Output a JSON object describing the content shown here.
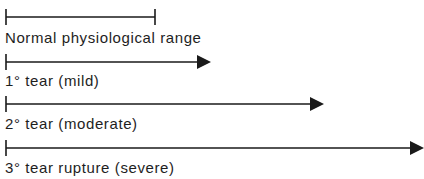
{
  "diagram": {
    "colors": {
      "line": "#1a1a1a",
      "text": "#1e1e1e",
      "background": "#ffffff"
    },
    "items": [
      {
        "label": "Normal physiological range",
        "start_x": 6,
        "end_x": 155,
        "line_y": 17,
        "end_type": "bar",
        "label_y": 31
      },
      {
        "label": "1° tear (mild)",
        "start_x": 6,
        "end_x": 210,
        "line_y": 62,
        "end_type": "arrow",
        "label_y": 74
      },
      {
        "label": "2° tear (moderate)",
        "start_x": 6,
        "end_x": 323,
        "line_y": 104,
        "end_type": "arrow",
        "label_y": 117
      },
      {
        "label": "3° tear rupture (severe)",
        "start_x": 6,
        "end_x": 423,
        "line_y": 148,
        "end_type": "arrow",
        "label_y": 161
      }
    ]
  }
}
